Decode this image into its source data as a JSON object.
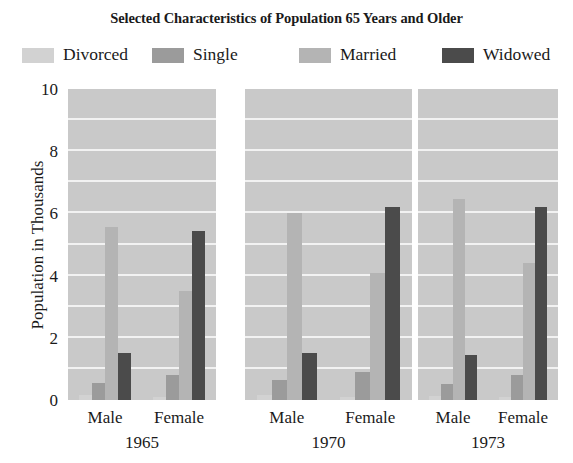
{
  "chart_data": {
    "type": "bar",
    "title": "Selected Characteristics of Population 65 Years and Older",
    "xlabel": "",
    "ylabel": "Population in Thousands",
    "ylim": [
      0,
      10
    ],
    "yticks": [
      "0",
      "2",
      "4",
      "6",
      "8",
      "10"
    ],
    "ytick_values": [
      0,
      2,
      4,
      6,
      8,
      10
    ],
    "grid": true,
    "grid_color": "#f2f2f2",
    "grid_step": 1,
    "panel_background": "#c9c9c9",
    "legend_position": "top",
    "categories": [
      "1965 Male",
      "1965 Female",
      "1970 Male",
      "1970 Female",
      "1973 Male",
      "1973 Female"
    ],
    "groups": [
      {
        "year": "1965",
        "sexes": [
          {
            "label": "Male",
            "values": [
              0.15,
              0.55,
              5.55,
              1.5
            ]
          },
          {
            "label": "Female",
            "values": [
              0.1,
              0.8,
              3.5,
              5.45
            ]
          }
        ]
      },
      {
        "year": "1970",
        "sexes": [
          {
            "label": "Male",
            "values": [
              0.15,
              0.65,
              6.0,
              1.5
            ]
          },
          {
            "label": "Female",
            "values": [
              0.1,
              0.9,
              4.1,
              6.2
            ]
          }
        ]
      },
      {
        "year": "1973",
        "sexes": [
          {
            "label": "Male",
            "values": [
              0.12,
              0.5,
              6.45,
              1.45
            ]
          },
          {
            "label": "Female",
            "values": [
              0.1,
              0.8,
              4.4,
              6.2
            ]
          }
        ]
      }
    ],
    "series": [
      {
        "name": "Divorced",
        "color": "#d2d2d2",
        "values": [
          0.15,
          0.1,
          0.15,
          0.1,
          0.12,
          0.1
        ]
      },
      {
        "name": "Single",
        "color": "#9b9b9b",
        "values": [
          0.55,
          0.8,
          0.65,
          0.9,
          0.5,
          0.8
        ]
      },
      {
        "name": "Married",
        "color": "#b4b4b4",
        "values": [
          5.55,
          3.5,
          6.0,
          4.1,
          6.45,
          4.4
        ]
      },
      {
        "name": "Widowed",
        "color": "#4b4b4b",
        "values": [
          1.5,
          5.45,
          1.5,
          6.2,
          1.45,
          6.2
        ]
      }
    ]
  },
  "legend": {
    "items": [
      {
        "label": "Divorced",
        "color": "#d2d2d2"
      },
      {
        "label": "Single",
        "color": "#9b9b9b"
      },
      {
        "label": "Married",
        "color": "#b4b4b4"
      },
      {
        "label": "Widowed",
        "color": "#4b4b4b"
      }
    ]
  },
  "axis": {
    "y_label": "Population in Thousands",
    "y_ticks": [
      "10",
      "8",
      "6",
      "4",
      "2",
      "0"
    ],
    "x_sex_labels": [
      "Male",
      "Female",
      "Male",
      "Female",
      "Male",
      "Female"
    ],
    "x_year_labels": [
      "1965",
      "1970",
      "1973"
    ]
  }
}
